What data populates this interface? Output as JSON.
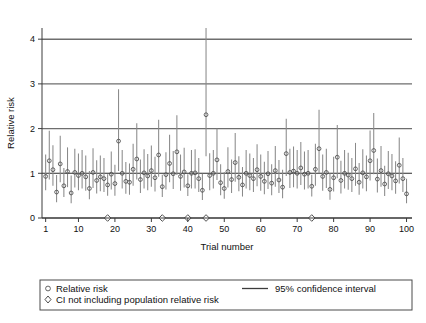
{
  "chart_data": {
    "type": "scatter",
    "title": "",
    "xlabel": "Trial number",
    "ylabel": "Relative risk",
    "xlim": [
      0.0,
      101.5
    ],
    "ylim": [
      0.0,
      4.25
    ],
    "xticks": [
      1,
      10,
      20,
      30,
      40,
      50,
      60,
      70,
      80,
      90,
      100
    ],
    "xticklabels": [
      "1",
      "10",
      "20",
      "30",
      "40",
      "50",
      "60",
      "70",
      "80",
      "90",
      "100"
    ],
    "yticks": [
      0,
      1,
      2,
      3,
      4
    ],
    "yticklabels": [
      "0",
      "1",
      "2",
      "3",
      "4"
    ],
    "grid": "horizontal-major",
    "reference_line": 1.0,
    "legend": {
      "position": "below-axes",
      "entries": [
        {
          "marker": "circle",
          "label": "Relative risk"
        },
        {
          "marker": "line",
          "label": "95% confidence interval"
        },
        {
          "marker": "diamond",
          "label": "CI not including population relative risk"
        }
      ]
    },
    "series_name": "Relative risk with 95% CI",
    "flagged_trials": [
      18,
      33,
      40,
      45,
      74
    ],
    "points": [
      {
        "trial": 1,
        "rr": 0.93,
        "lo": 0.62,
        "hi": 1.42
      },
      {
        "trial": 2,
        "rr": 1.28,
        "lo": 0.86,
        "hi": 1.95
      },
      {
        "trial": 3,
        "rr": 1.08,
        "lo": 0.72,
        "hi": 1.63
      },
      {
        "trial": 4,
        "rr": 0.58,
        "lo": 0.35,
        "hi": 0.96
      },
      {
        "trial": 5,
        "rr": 1.21,
        "lo": 0.8,
        "hi": 1.84
      },
      {
        "trial": 6,
        "rr": 0.72,
        "lo": 0.47,
        "hi": 1.12
      },
      {
        "trial": 7,
        "rr": 1.04,
        "lo": 0.69,
        "hi": 1.58
      },
      {
        "trial": 8,
        "rr": 0.56,
        "lo": 0.33,
        "hi": 0.95
      },
      {
        "trial": 9,
        "rr": 1.02,
        "lo": 0.68,
        "hi": 1.55
      },
      {
        "trial": 10,
        "rr": 0.95,
        "lo": 0.62,
        "hi": 1.44
      },
      {
        "trial": 11,
        "rr": 1.0,
        "lo": 0.66,
        "hi": 1.52
      },
      {
        "trial": 12,
        "rr": 0.92,
        "lo": 0.61,
        "hi": 1.4
      },
      {
        "trial": 13,
        "rr": 0.66,
        "lo": 0.42,
        "hi": 1.05
      },
      {
        "trial": 14,
        "rr": 1.02,
        "lo": 0.67,
        "hi": 1.56
      },
      {
        "trial": 15,
        "rr": 0.84,
        "lo": 0.55,
        "hi": 1.29
      },
      {
        "trial": 16,
        "rr": 0.92,
        "lo": 0.6,
        "hi": 1.4
      },
      {
        "trial": 17,
        "rr": 0.88,
        "lo": 0.58,
        "hi": 1.34
      },
      {
        "trial": 18,
        "rr": 0.74,
        "lo": 0.5,
        "hi": 0.98,
        "flagged": true
      },
      {
        "trial": 19,
        "rr": 0.98,
        "lo": 0.64,
        "hi": 1.49
      },
      {
        "trial": 20,
        "rr": 0.77,
        "lo": 0.5,
        "hi": 1.19
      },
      {
        "trial": 21,
        "rr": 1.72,
        "lo": 1.05,
        "hi": 2.88
      },
      {
        "trial": 22,
        "rr": 1.0,
        "lo": 0.66,
        "hi": 1.52
      },
      {
        "trial": 23,
        "rr": 0.82,
        "lo": 0.54,
        "hi": 1.25
      },
      {
        "trial": 24,
        "rr": 0.8,
        "lo": 0.52,
        "hi": 1.22
      },
      {
        "trial": 25,
        "rr": 1.09,
        "lo": 0.72,
        "hi": 1.66
      },
      {
        "trial": 26,
        "rr": 1.32,
        "lo": 0.86,
        "hi": 2.12
      },
      {
        "trial": 27,
        "rr": 0.86,
        "lo": 0.56,
        "hi": 1.31
      },
      {
        "trial": 28,
        "rr": 1.01,
        "lo": 0.66,
        "hi": 1.54
      },
      {
        "trial": 29,
        "rr": 0.94,
        "lo": 0.62,
        "hi": 1.43
      },
      {
        "trial": 30,
        "rr": 1.06,
        "lo": 0.7,
        "hi": 1.62
      },
      {
        "trial": 31,
        "rr": 0.9,
        "lo": 0.59,
        "hi": 1.37
      },
      {
        "trial": 32,
        "rr": 1.41,
        "lo": 0.92,
        "hi": 2.2
      },
      {
        "trial": 33,
        "rr": 0.7,
        "lo": 0.47,
        "hi": 0.97,
        "flagged": true
      },
      {
        "trial": 34,
        "rr": 0.97,
        "lo": 0.64,
        "hi": 1.47
      },
      {
        "trial": 35,
        "rr": 1.22,
        "lo": 0.8,
        "hi": 1.86
      },
      {
        "trial": 36,
        "rr": 0.99,
        "lo": 0.65,
        "hi": 1.5
      },
      {
        "trial": 37,
        "rr": 1.48,
        "lo": 0.96,
        "hi": 2.3
      },
      {
        "trial": 38,
        "rr": 0.93,
        "lo": 0.61,
        "hi": 1.42
      },
      {
        "trial": 39,
        "rr": 1.03,
        "lo": 0.68,
        "hi": 1.57
      },
      {
        "trial": 40,
        "rr": 0.72,
        "lo": 0.49,
        "hi": 0.98,
        "flagged": true
      },
      {
        "trial": 41,
        "rr": 1.0,
        "lo": 0.66,
        "hi": 1.52
      },
      {
        "trial": 42,
        "rr": 1.01,
        "lo": 0.66,
        "hi": 1.54
      },
      {
        "trial": 43,
        "rr": 0.88,
        "lo": 0.58,
        "hi": 1.34
      },
      {
        "trial": 44,
        "rr": 0.62,
        "lo": 0.4,
        "hi": 0.99
      },
      {
        "trial": 45,
        "rr": 2.31,
        "lo": 1.38,
        "hi": 4.3,
        "flagged": true
      },
      {
        "trial": 46,
        "rr": 0.95,
        "lo": 0.62,
        "hi": 1.45
      },
      {
        "trial": 47,
        "rr": 1.0,
        "lo": 0.66,
        "hi": 1.52
      },
      {
        "trial": 48,
        "rr": 1.3,
        "lo": 0.85,
        "hi": 2.0
      },
      {
        "trial": 49,
        "rr": 0.79,
        "lo": 0.51,
        "hi": 1.2
      },
      {
        "trial": 50,
        "rr": 0.66,
        "lo": 0.43,
        "hi": 1.03
      },
      {
        "trial": 51,
        "rr": 1.04,
        "lo": 0.68,
        "hi": 1.58
      },
      {
        "trial": 52,
        "rr": 0.86,
        "lo": 0.56,
        "hi": 1.31
      },
      {
        "trial": 53,
        "rr": 1.24,
        "lo": 0.81,
        "hi": 1.9
      },
      {
        "trial": 54,
        "rr": 0.91,
        "lo": 0.6,
        "hi": 1.38
      },
      {
        "trial": 55,
        "rr": 0.74,
        "lo": 0.48,
        "hi": 1.14
      },
      {
        "trial": 56,
        "rr": 1.0,
        "lo": 0.66,
        "hi": 1.52
      },
      {
        "trial": 57,
        "rr": 0.95,
        "lo": 0.62,
        "hi": 1.44
      },
      {
        "trial": 58,
        "rr": 0.88,
        "lo": 0.58,
        "hi": 1.34
      },
      {
        "trial": 59,
        "rr": 1.08,
        "lo": 0.71,
        "hi": 1.65
      },
      {
        "trial": 60,
        "rr": 0.93,
        "lo": 0.61,
        "hi": 1.42
      },
      {
        "trial": 61,
        "rr": 0.82,
        "lo": 0.53,
        "hi": 1.26
      },
      {
        "trial": 62,
        "rr": 0.99,
        "lo": 0.65,
        "hi": 1.5
      },
      {
        "trial": 63,
        "rr": 0.78,
        "lo": 0.51,
        "hi": 1.2
      },
      {
        "trial": 64,
        "rr": 1.06,
        "lo": 0.7,
        "hi": 1.61
      },
      {
        "trial": 65,
        "rr": 0.85,
        "lo": 0.56,
        "hi": 1.3
      },
      {
        "trial": 66,
        "rr": 0.69,
        "lo": 0.44,
        "hi": 1.08
      },
      {
        "trial": 67,
        "rr": 1.44,
        "lo": 0.94,
        "hi": 2.22
      },
      {
        "trial": 68,
        "rr": 1.02,
        "lo": 0.67,
        "hi": 1.55
      },
      {
        "trial": 69,
        "rr": 1.05,
        "lo": 0.69,
        "hi": 1.6
      },
      {
        "trial": 70,
        "rr": 1.0,
        "lo": 0.66,
        "hi": 1.52
      },
      {
        "trial": 71,
        "rr": 1.12,
        "lo": 0.74,
        "hi": 1.7
      },
      {
        "trial": 72,
        "rr": 0.98,
        "lo": 0.64,
        "hi": 1.49
      },
      {
        "trial": 73,
        "rr": 1.0,
        "lo": 0.66,
        "hi": 1.52
      },
      {
        "trial": 74,
        "rr": 0.71,
        "lo": 0.48,
        "hi": 0.97,
        "flagged": true
      },
      {
        "trial": 75,
        "rr": 1.09,
        "lo": 0.72,
        "hi": 1.66
      },
      {
        "trial": 76,
        "rr": 1.55,
        "lo": 1.0,
        "hi": 2.42
      },
      {
        "trial": 77,
        "rr": 0.93,
        "lo": 0.61,
        "hi": 1.42
      },
      {
        "trial": 78,
        "rr": 1.02,
        "lo": 0.67,
        "hi": 1.55
      },
      {
        "trial": 79,
        "rr": 0.64,
        "lo": 0.41,
        "hi": 1.0
      },
      {
        "trial": 80,
        "rr": 0.9,
        "lo": 0.59,
        "hi": 1.37
      },
      {
        "trial": 81,
        "rr": 1.36,
        "lo": 0.89,
        "hi": 2.08
      },
      {
        "trial": 82,
        "rr": 0.84,
        "lo": 0.55,
        "hi": 1.28
      },
      {
        "trial": 83,
        "rr": 1.0,
        "lo": 0.66,
        "hi": 1.52
      },
      {
        "trial": 84,
        "rr": 0.96,
        "lo": 0.63,
        "hi": 1.46
      },
      {
        "trial": 85,
        "rr": 0.88,
        "lo": 0.58,
        "hi": 1.34
      },
      {
        "trial": 86,
        "rr": 1.1,
        "lo": 0.72,
        "hi": 1.68
      },
      {
        "trial": 87,
        "rr": 0.8,
        "lo": 0.52,
        "hi": 1.23
      },
      {
        "trial": 88,
        "rr": 1.01,
        "lo": 0.66,
        "hi": 1.54
      },
      {
        "trial": 89,
        "rr": 0.92,
        "lo": 0.6,
        "hi": 1.4
      },
      {
        "trial": 90,
        "rr": 1.28,
        "lo": 0.84,
        "hi": 1.96
      },
      {
        "trial": 91,
        "rr": 1.51,
        "lo": 0.98,
        "hi": 2.35
      },
      {
        "trial": 92,
        "rr": 0.87,
        "lo": 0.57,
        "hi": 1.33
      },
      {
        "trial": 93,
        "rr": 1.06,
        "lo": 0.7,
        "hi": 1.61
      },
      {
        "trial": 94,
        "rr": 0.76,
        "lo": 0.49,
        "hi": 1.17
      },
      {
        "trial": 95,
        "rr": 0.99,
        "lo": 0.65,
        "hi": 1.5
      },
      {
        "trial": 96,
        "rr": 0.94,
        "lo": 0.62,
        "hi": 1.43
      },
      {
        "trial": 97,
        "rr": 0.83,
        "lo": 0.54,
        "hi": 1.27
      },
      {
        "trial": 98,
        "rr": 1.18,
        "lo": 0.77,
        "hi": 1.8
      },
      {
        "trial": 99,
        "rr": 0.88,
        "lo": 0.58,
        "hi": 1.34
      },
      {
        "trial": 100,
        "rr": 0.54,
        "lo": 0.33,
        "hi": 0.88
      }
    ]
  },
  "colors": {
    "ci_line": "#8a8a8a",
    "marker": "#4a4a4a",
    "grid": "#6e6e6e",
    "axis": "#3c3c3c",
    "background": "#ffffff"
  }
}
